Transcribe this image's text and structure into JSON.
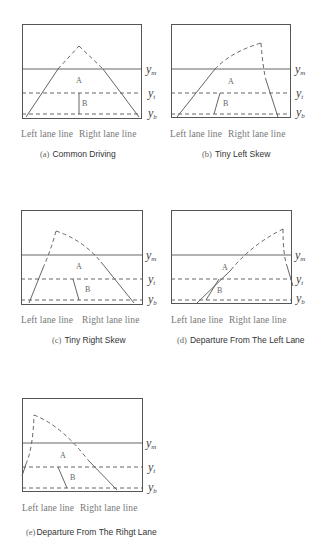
{
  "figure": {
    "line_color": "#555555",
    "background": "#ffffff",
    "y_labels": {
      "m": {
        "base": "y",
        "sub": "m"
      },
      "t": {
        "base": "y",
        "sub": "t"
      },
      "b": {
        "base": "y",
        "sub": "b"
      }
    },
    "lane_labels": {
      "left": "Left lane line",
      "right": "Right lane line"
    },
    "region_labels": {
      "a": "A",
      "b": "B"
    },
    "panels": [
      {
        "id": "a",
        "tag": "(a)",
        "title": "Common Driving"
      },
      {
        "id": "b",
        "tag": "(b)",
        "title": "Tiny Left Skew"
      },
      {
        "id": "c",
        "tag": "(c)",
        "title": "Tiny Right Skew"
      },
      {
        "id": "d",
        "tag": "(d)",
        "title": "Departure From The Left Lane"
      },
      {
        "id": "e",
        "tag": "(e)",
        "title": "Departure From The Rihgt Lane"
      }
    ]
  }
}
